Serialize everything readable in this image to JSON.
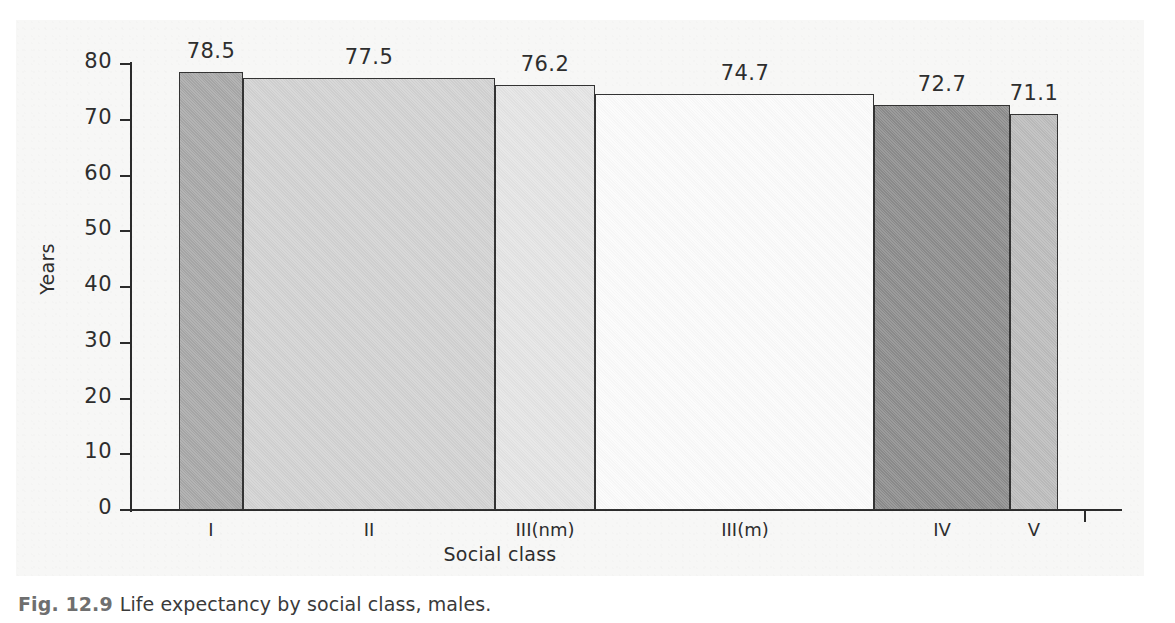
{
  "figure": {
    "caption_prefix": "Fig. 12.9",
    "caption_text": "Life expectancy by social class, males."
  },
  "chart_data": {
    "type": "bar",
    "title": "",
    "xlabel": "Social class",
    "ylabel": "Years",
    "categories": [
      "I",
      "II",
      "III(nm)",
      "III(m)",
      "IV",
      "V"
    ],
    "values": [
      78.5,
      77.5,
      76.2,
      74.7,
      72.7,
      71.1
    ],
    "value_labels": [
      "78.5",
      "77.5",
      "76.2",
      "74.7",
      "72.7",
      "71.1"
    ],
    "bar_widths_relative": [
      "narrow",
      "wide",
      "medium",
      "wide",
      "medium",
      "narrow"
    ],
    "bar_colors": [
      "#a8a8a8",
      "#d2d2d2",
      "#e4e4e4",
      "#fbfbfb",
      "#8c8c8c",
      "#bcbcbc"
    ],
    "ylim": [
      0,
      80
    ],
    "ytick_labels": [
      "0",
      "10",
      "20",
      "30",
      "40",
      "50",
      "60",
      "70",
      "80"
    ],
    "ytick_values": [
      0,
      10,
      20,
      30,
      40,
      50,
      60,
      70,
      80
    ],
    "grid": false,
    "legend": false
  },
  "colors": {
    "page_background": "#ffffff",
    "panel_background": "#f7f7f6",
    "axis": "#2b2b2b",
    "text": "#2e2e2e",
    "caption_figno": "#6f6f6f"
  }
}
